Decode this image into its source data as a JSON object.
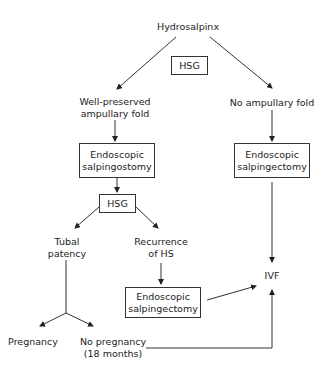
{
  "diagram": {
    "root": "Hydrosalpinx",
    "hsg_top": "HSG",
    "left_branch": {
      "line1": "Well-preserved",
      "line2": "ampullary fold"
    },
    "right_branch": "No ampullary fold",
    "salpingostomy": {
      "line1": "Endoscopic",
      "line2": "salpingostomy"
    },
    "salpingectomy_right": {
      "line1": "Endoscopic",
      "line2": "salpingectomy"
    },
    "hsg_mid": "HSG",
    "tubal_patency": {
      "line1": "Tubal",
      "line2": "patency"
    },
    "recurrence": {
      "line1": "Recurrence",
      "line2": "of HS"
    },
    "salpingectomy_mid": {
      "line1": "Endoscopic",
      "line2": "salpingectomy"
    },
    "ivf": "IVF",
    "pregnancy": "Pregnancy",
    "no_pregnancy": {
      "line1": "No pregnancy",
      "line2": "(18 months)"
    }
  }
}
